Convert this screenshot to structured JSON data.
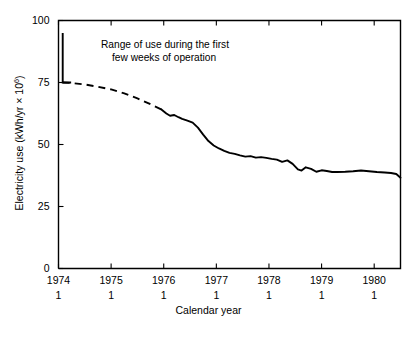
{
  "chart_data": {
    "type": "line",
    "title": "",
    "xlabel": "Calendar year",
    "ylabel": "Electricity use (kWh/yr × 10⁶)",
    "ylabel_prefix": "Electricity use (kWh/yr × 10",
    "ylabel_superscript": "6",
    "ylabel_suffix": ")",
    "xlim": [
      1974.0,
      1980.5
    ],
    "ylim": [
      0,
      100
    ],
    "grid": false,
    "legend": null,
    "xticks": [
      1974,
      1975,
      1976,
      1977,
      1978,
      1979,
      1980
    ],
    "xtick_labels": [
      "1974",
      "1975",
      "1976",
      "1977",
      "1978",
      "1979",
      "1980"
    ],
    "xtick_sublabels": [
      "1",
      "1",
      "1",
      "1",
      "1",
      "1",
      "1"
    ],
    "yticks": [
      0,
      25,
      50,
      75,
      100
    ],
    "ytick_labels": [
      "0",
      "25",
      "50",
      "75",
      "100"
    ],
    "annotations": [
      {
        "name": "range-of-use-note",
        "line1": "Range of use during the first",
        "line2": "few weeks of operation"
      }
    ],
    "range_bar": {
      "x": 1974.08,
      "y_top": 95,
      "y_bottom": 75,
      "foot_width_years": 0.16
    },
    "series": [
      {
        "name": "electricity-use-dashed",
        "style": "dashed",
        "x": [
          1974.08,
          1974.25,
          1974.5,
          1974.75,
          1975.0,
          1975.25,
          1975.5,
          1975.75,
          1975.95
        ],
        "y": [
          75.0,
          74.8,
          74.2,
          73.3,
          72.2,
          70.6,
          68.6,
          66.2,
          64.2
        ]
      },
      {
        "name": "electricity-use-solid",
        "style": "solid",
        "x": [
          1975.95,
          1976.05,
          1976.12,
          1976.2,
          1976.28,
          1976.35,
          1976.45,
          1976.55,
          1976.65,
          1976.75,
          1976.85,
          1976.95,
          1977.05,
          1977.15,
          1977.25,
          1977.35,
          1977.45,
          1977.55,
          1977.65,
          1977.75,
          1977.85,
          1977.95,
          1978.05,
          1978.15,
          1978.25,
          1978.35,
          1978.45,
          1978.55,
          1978.62,
          1978.7,
          1978.8,
          1978.9,
          1979.0,
          1979.1,
          1979.2,
          1979.3,
          1979.45,
          1979.6,
          1979.75,
          1979.9,
          1980.05,
          1980.2,
          1980.32,
          1980.42,
          1980.5
        ],
        "y": [
          64.2,
          62.5,
          61.6,
          61.9,
          61.0,
          60.3,
          59.6,
          58.8,
          56.8,
          54.0,
          51.4,
          49.6,
          48.4,
          47.4,
          46.6,
          46.2,
          45.6,
          45.1,
          45.3,
          44.7,
          44.9,
          44.6,
          44.2,
          43.9,
          43.0,
          43.6,
          42.2,
          40.0,
          39.5,
          40.8,
          40.2,
          39.0,
          39.6,
          39.3,
          38.9,
          38.9,
          39.0,
          39.2,
          39.5,
          39.2,
          38.9,
          38.7,
          38.5,
          38.1,
          36.6
        ]
      }
    ]
  },
  "axis_titles": {
    "x": "Calendar year"
  }
}
